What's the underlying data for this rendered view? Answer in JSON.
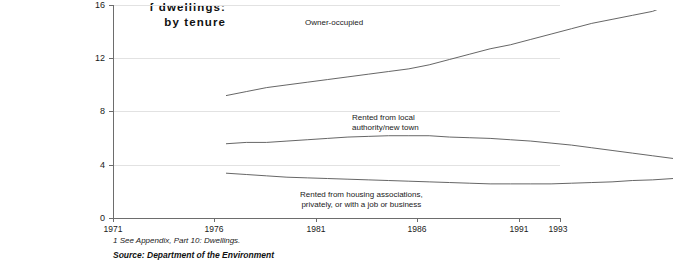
{
  "title": {
    "line1": "f dwellings:",
    "line2": "by tenure"
  },
  "footnotes": {
    "appendix": "1 See Appendix, Part 10: Dwellings.",
    "source": "Source: Department of the Environment"
  },
  "labels": {
    "owner_occupied": "Owner-occupied",
    "local_authority": "Rented from local\nauthority/new town",
    "other_rented": "Rented from housing associations,\nprivately, or with a job or business"
  },
  "chart_data": {
    "type": "line",
    "title": "f dwellings: by tenure",
    "xlabel": "",
    "ylabel": "",
    "xlim": [
      1971,
      1993
    ],
    "ylim": [
      0,
      16
    ],
    "yticks": [
      0,
      4,
      8,
      12,
      16
    ],
    "xticks": [
      1971,
      1976,
      1981,
      1986,
      1991,
      1993
    ],
    "grid": true,
    "legend": "inline-annotations",
    "x": [
      1971,
      1972,
      1973,
      1974,
      1975,
      1976,
      1977,
      1978,
      1979,
      1980,
      1981,
      1982,
      1983,
      1984,
      1985,
      1986,
      1987,
      1988,
      1989,
      1990,
      1991,
      1992,
      1993
    ],
    "series": [
      {
        "name": "Owner-occupied",
        "values": [
          9.6,
          9.9,
          10.2,
          10.4,
          10.6,
          10.8,
          11.0,
          11.2,
          11.4,
          11.6,
          11.9,
          12.3,
          12.7,
          13.1,
          13.4,
          13.8,
          14.2,
          14.6,
          15.0,
          15.3,
          15.6,
          15.9,
          16.5
        ]
      },
      {
        "name": "Rented from local authority/new town",
        "values": [
          6.0,
          6.1,
          6.1,
          6.2,
          6.3,
          6.4,
          6.5,
          6.55,
          6.6,
          6.6,
          6.6,
          6.5,
          6.45,
          6.4,
          6.3,
          6.2,
          6.05,
          5.9,
          5.7,
          5.5,
          5.3,
          5.1,
          4.9
        ]
      },
      {
        "name": "Rented from housing associations, privately, or with a job or business",
        "values": [
          3.8,
          3.7,
          3.6,
          3.5,
          3.45,
          3.4,
          3.35,
          3.3,
          3.25,
          3.2,
          3.15,
          3.1,
          3.05,
          3.0,
          3.0,
          3.0,
          3.0,
          3.05,
          3.1,
          3.15,
          3.25,
          3.3,
          3.4
        ]
      }
    ]
  }
}
